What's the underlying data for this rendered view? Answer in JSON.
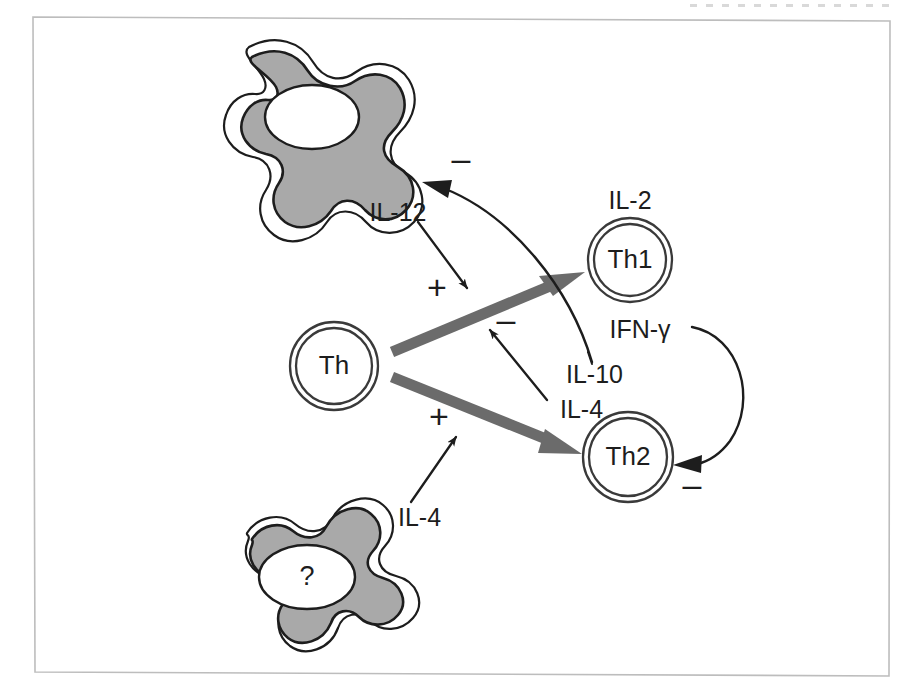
{
  "figure": {
    "background_color": "#ffffff",
    "frame_color": "#bdbdbd",
    "cell_fill_color": "#a9a9a9",
    "outline_color": "#1d1d1d",
    "thick_arrow_color": "#6b6b6b"
  },
  "cells": {
    "macrophage_top": {
      "name": "macrophage-top",
      "nucleus_label": ""
    },
    "macrophage_bottom": {
      "name": "macrophage-bottom",
      "nucleus_label": "?"
    },
    "th": {
      "label": "Th"
    },
    "th1": {
      "label": "Th1"
    },
    "th2": {
      "label": "Th2"
    }
  },
  "cytokines": {
    "il12": "IL-12",
    "il2": "IL-2",
    "ifn_gamma": "IFN-γ",
    "il10": "IL-10",
    "il4_middle": "IL-4",
    "il4_bottom": "IL-4"
  },
  "signs": {
    "minus_macrophage": "–",
    "plus_il12": "+",
    "minus_il4_to_th1": "–",
    "plus_il4_bottom": "+",
    "minus_ifn_to_th2": "–"
  },
  "relations": [
    {
      "from": "macrophage_top",
      "to": "Th→Th1 pathway",
      "mediator": "IL-12",
      "sign": "+"
    },
    {
      "from": "Th",
      "to": "Th1",
      "mediator": "",
      "sign": "+"
    },
    {
      "from": "Th",
      "to": "Th2",
      "mediator": "",
      "sign": "+"
    },
    {
      "from": "macrophage_bottom",
      "to": "Th→Th2 pathway",
      "mediator": "IL-4",
      "sign": "+"
    },
    {
      "from": "Th2",
      "to": "Th→Th1 pathway",
      "mediator": "IL-4",
      "sign": "–"
    },
    {
      "from": "Th1",
      "to": "macrophage_top",
      "mediator": "IL-10",
      "sign": "–"
    },
    {
      "from": "Th1",
      "to": "Th2",
      "mediator": "IFN-γ",
      "sign": "–"
    }
  ],
  "th1_products": [
    "IL-2",
    "IFN-γ"
  ],
  "th2_products": [
    "IL-4",
    "IL-10"
  ]
}
